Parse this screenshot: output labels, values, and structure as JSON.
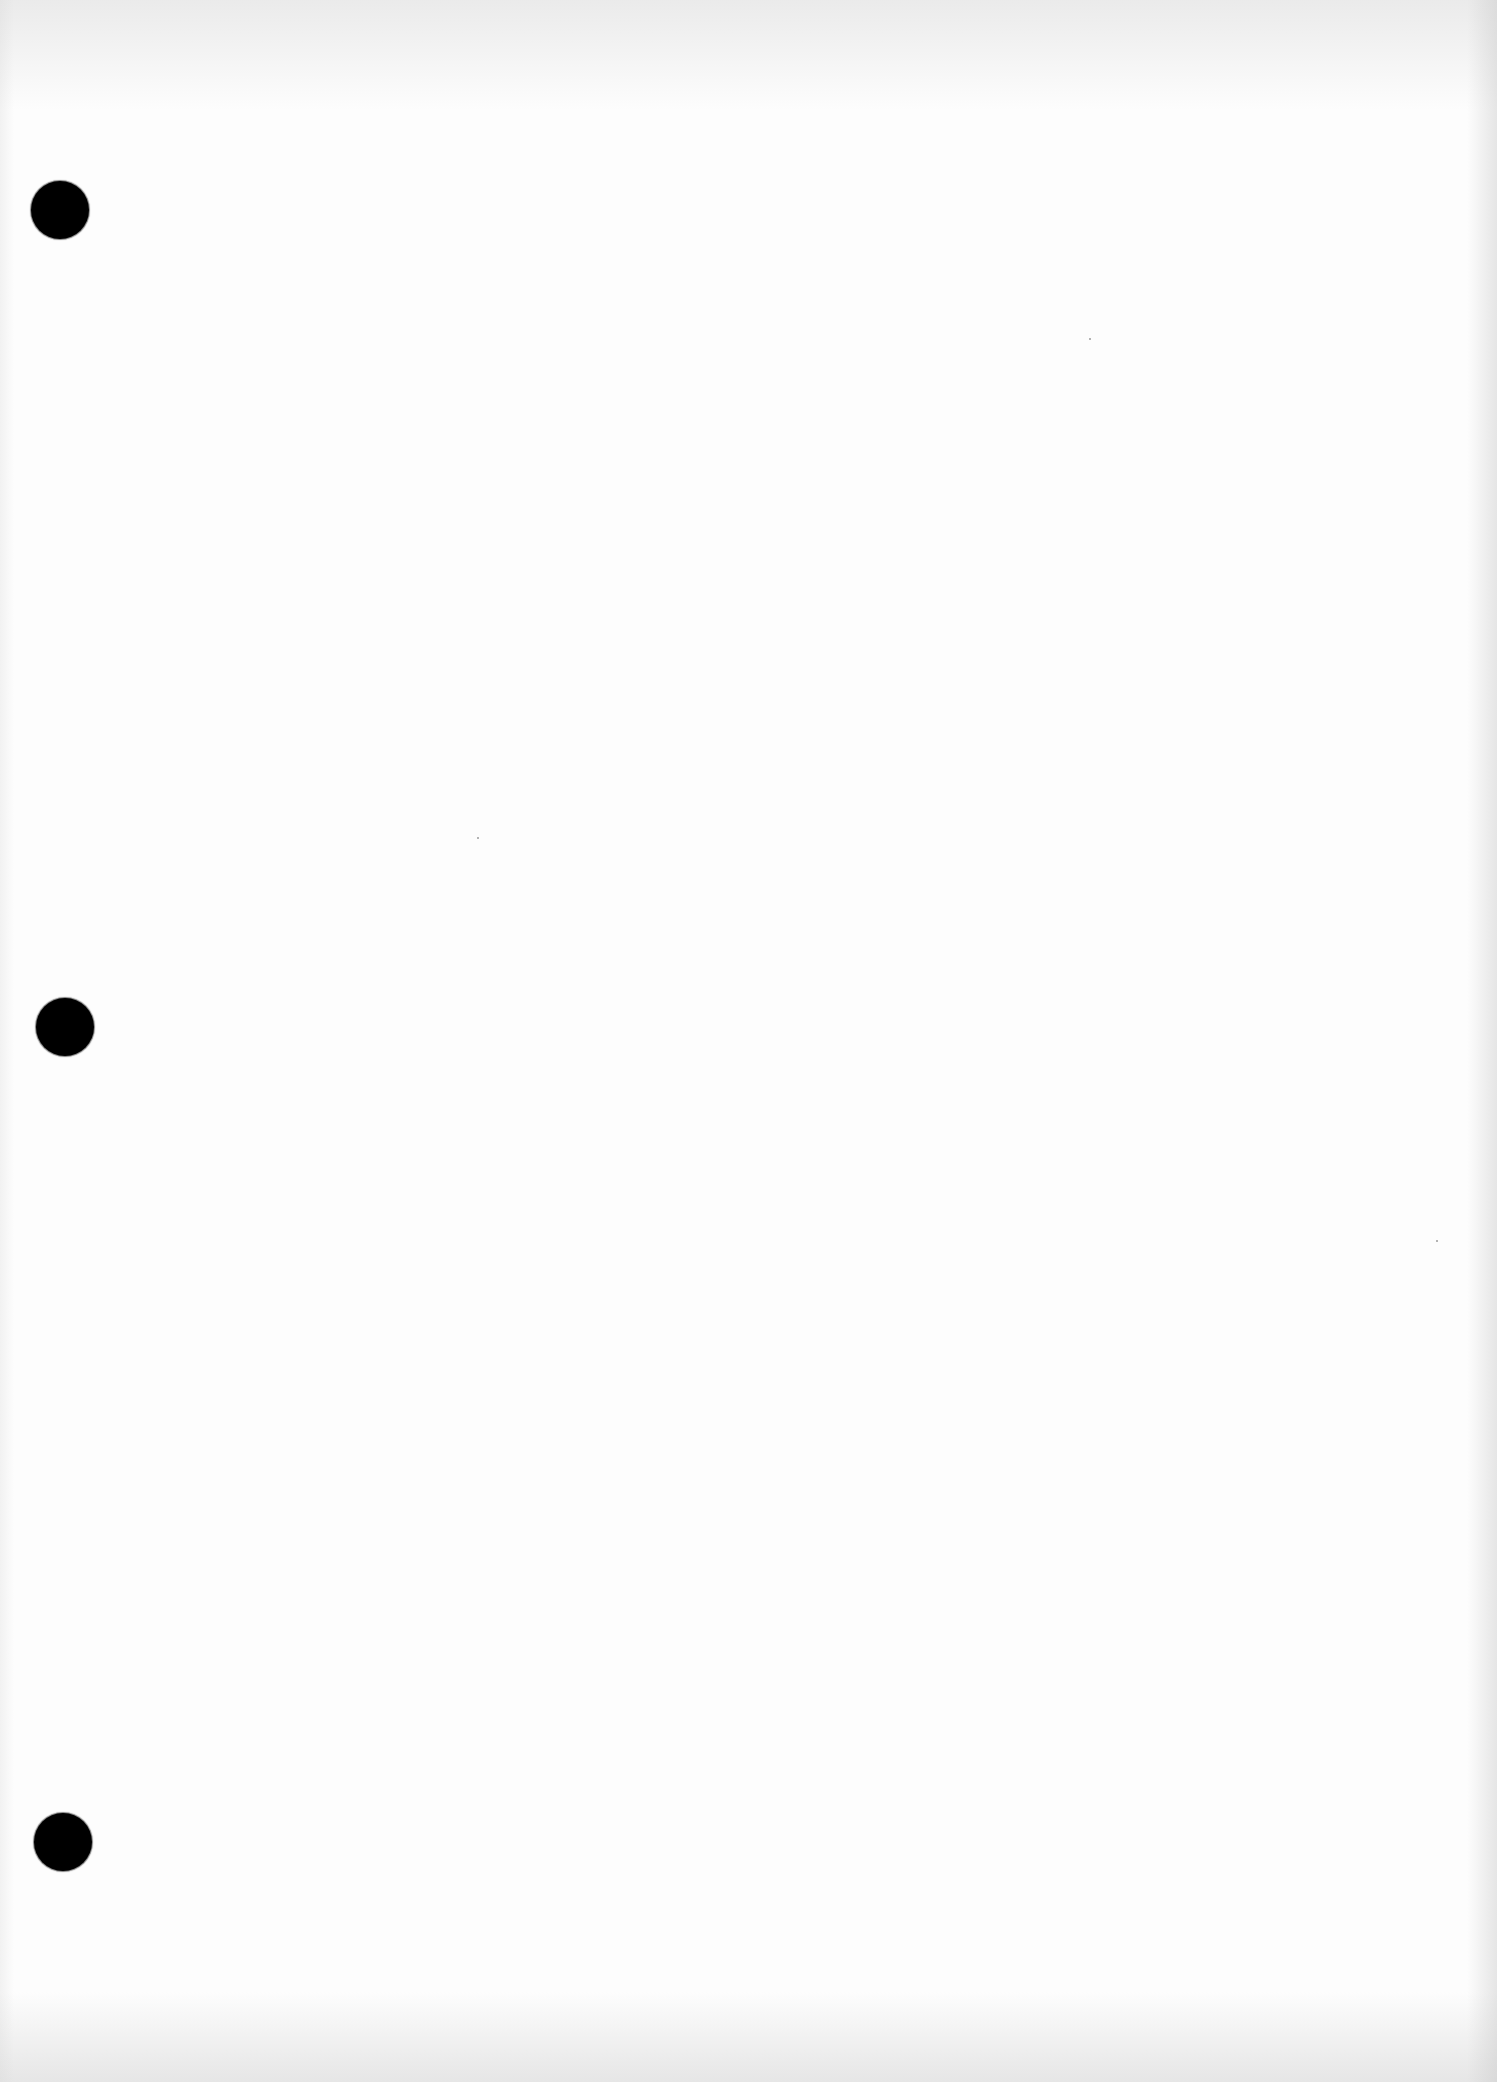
{
  "document": {
    "type": "blank scanned page",
    "text": "",
    "background_color": "#fdfdfd",
    "punch_holes": [
      {
        "cx": 60,
        "cy": 210,
        "d": 58,
        "color": "#000000"
      },
      {
        "cx": 65,
        "cy": 1027,
        "d": 58,
        "color": "#000000"
      },
      {
        "cx": 63,
        "cy": 1842,
        "d": 58,
        "color": "#000000"
      }
    ],
    "specks": [
      {
        "x": 1089,
        "y": 338
      },
      {
        "x": 1436,
        "y": 1240
      },
      {
        "x": 477,
        "y": 837
      }
    ]
  }
}
